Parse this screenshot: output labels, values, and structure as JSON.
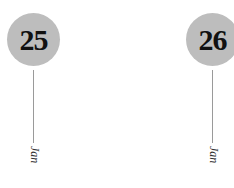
{
  "dates": [
    {
      "day": "25",
      "month": "Jan"
    },
    {
      "day": "26",
      "month": "Jan"
    }
  ],
  "colors": {
    "circle": "#bdbdbd",
    "line": "#9a9a9a",
    "text": "#111111"
  }
}
